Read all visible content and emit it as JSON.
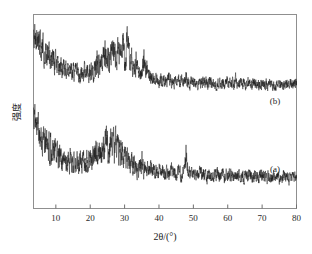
{
  "figure": {
    "title": "",
    "background_color": "#ffffff",
    "frame_color": "#8f8f8f",
    "trace_color": "#1c1c1c"
  },
  "axes": {
    "xlabel": "2θ/(°)",
    "ylabel": "强度",
    "x_ticks": [
      "10",
      "20",
      "30",
      "40",
      "50",
      "60",
      "70",
      "80"
    ]
  },
  "annotations": {
    "upper_curve_label": "(b)",
    "lower_curve_label": "(a)"
  },
  "chart_data": {
    "type": "line",
    "title": "",
    "xlabel": "2θ/(°)",
    "ylabel": "强度",
    "xlim": [
      3.5,
      80
    ],
    "ylim": [
      0,
      1
    ],
    "grid": false,
    "legend": "inline-right",
    "xticks": [
      10,
      20,
      30,
      40,
      50,
      60,
      70,
      80
    ],
    "yticks": [],
    "series": [
      {
        "name": "(b)",
        "offset": 0.62,
        "noise_amplitude": 0.052,
        "baseline_points": [
          {
            "x": 3.5,
            "y": 0.3
          },
          {
            "x": 5.0,
            "y": 0.25
          },
          {
            "x": 7.0,
            "y": 0.185
          },
          {
            "x": 9.0,
            "y": 0.14
          },
          {
            "x": 11.0,
            "y": 0.11
          },
          {
            "x": 13.0,
            "y": 0.092
          },
          {
            "x": 15.0,
            "y": 0.082
          },
          {
            "x": 17.0,
            "y": 0.08
          },
          {
            "x": 19.0,
            "y": 0.085
          },
          {
            "x": 21.0,
            "y": 0.098
          },
          {
            "x": 23.0,
            "y": 0.118
          },
          {
            "x": 25.0,
            "y": 0.14
          },
          {
            "x": 26.5,
            "y": 0.152
          },
          {
            "x": 28.0,
            "y": 0.155
          },
          {
            "x": 30.0,
            "y": 0.14
          },
          {
            "x": 32.0,
            "y": 0.105
          },
          {
            "x": 34.0,
            "y": 0.075
          },
          {
            "x": 36.0,
            "y": 0.06
          },
          {
            "x": 38.0,
            "y": 0.05
          },
          {
            "x": 41.0,
            "y": 0.042
          },
          {
            "x": 45.0,
            "y": 0.035
          },
          {
            "x": 50.0,
            "y": 0.03
          },
          {
            "x": 55.0,
            "y": 0.026
          },
          {
            "x": 60.0,
            "y": 0.024
          },
          {
            "x": 65.0,
            "y": 0.022
          },
          {
            "x": 70.0,
            "y": 0.02
          },
          {
            "x": 75.0,
            "y": 0.018
          },
          {
            "x": 80.0,
            "y": 0.016
          }
        ],
        "peaks": [
          {
            "x": 26.5,
            "height": 0.055,
            "width": 0.55
          },
          {
            "x": 28.2,
            "height": 0.05,
            "width": 0.45
          },
          {
            "x": 29.4,
            "height": 0.075,
            "width": 0.4
          },
          {
            "x": 30.9,
            "height": 0.15,
            "width": 0.35
          },
          {
            "x": 31.8,
            "height": 0.06,
            "width": 0.35
          },
          {
            "x": 33.4,
            "height": 0.055,
            "width": 0.35
          },
          {
            "x": 35.6,
            "height": 0.095,
            "width": 0.35
          },
          {
            "x": 36.4,
            "height": 0.05,
            "width": 0.35
          },
          {
            "x": 24.0,
            "height": 0.045,
            "width": 0.5
          },
          {
            "x": 22.0,
            "height": 0.038,
            "width": 0.5
          },
          {
            "x": 47.9,
            "height": 0.03,
            "width": 0.35
          },
          {
            "x": 43.0,
            "height": 0.028,
            "width": 0.35
          },
          {
            "x": 62.5,
            "height": 0.025,
            "width": 0.35
          }
        ]
      },
      {
        "name": "(a)",
        "offset": 0.145,
        "noise_amplitude": 0.06,
        "baseline_points": [
          {
            "x": 3.5,
            "y": 0.33
          },
          {
            "x": 5.0,
            "y": 0.27
          },
          {
            "x": 7.0,
            "y": 0.195
          },
          {
            "x": 9.0,
            "y": 0.145
          },
          {
            "x": 11.0,
            "y": 0.115
          },
          {
            "x": 13.0,
            "y": 0.098
          },
          {
            "x": 15.0,
            "y": 0.09
          },
          {
            "x": 17.0,
            "y": 0.09
          },
          {
            "x": 19.0,
            "y": 0.098
          },
          {
            "x": 21.0,
            "y": 0.112
          },
          {
            "x": 23.0,
            "y": 0.13
          },
          {
            "x": 25.0,
            "y": 0.145
          },
          {
            "x": 26.5,
            "y": 0.15
          },
          {
            "x": 28.0,
            "y": 0.142
          },
          {
            "x": 30.0,
            "y": 0.115
          },
          {
            "x": 32.0,
            "y": 0.085
          },
          {
            "x": 34.0,
            "y": 0.065
          },
          {
            "x": 36.0,
            "y": 0.055
          },
          {
            "x": 38.0,
            "y": 0.048
          },
          {
            "x": 41.0,
            "y": 0.042
          },
          {
            "x": 45.0,
            "y": 0.036
          },
          {
            "x": 50.0,
            "y": 0.032
          },
          {
            "x": 55.0,
            "y": 0.028
          },
          {
            "x": 60.0,
            "y": 0.026
          },
          {
            "x": 65.0,
            "y": 0.024
          },
          {
            "x": 70.0,
            "y": 0.02
          },
          {
            "x": 75.0,
            "y": 0.016
          },
          {
            "x": 80.0,
            "y": 0.012
          }
        ],
        "peaks": [
          {
            "x": 24.5,
            "height": 0.048,
            "width": 0.6
          },
          {
            "x": 26.3,
            "height": 0.055,
            "width": 0.55
          },
          {
            "x": 27.8,
            "height": 0.045,
            "width": 0.5
          },
          {
            "x": 29.5,
            "height": 0.042,
            "width": 0.45
          },
          {
            "x": 47.9,
            "height": 0.085,
            "width": 0.32
          },
          {
            "x": 21.5,
            "height": 0.035,
            "width": 0.5
          },
          {
            "x": 35.0,
            "height": 0.03,
            "width": 0.4
          },
          {
            "x": 57.0,
            "height": 0.025,
            "width": 0.35
          }
        ]
      }
    ]
  }
}
